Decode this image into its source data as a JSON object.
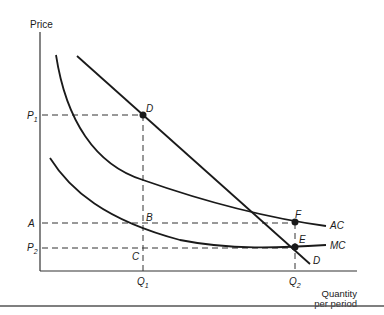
{
  "axes": {
    "y_label": "Price",
    "x_label_line1": "Quantity",
    "x_label_line2": "per period"
  },
  "price_levels": {
    "p1": "P",
    "p1_sub": "1",
    "a": "A",
    "p2": "P",
    "p2_sub": "2"
  },
  "quantity_levels": {
    "q1": "Q",
    "q1_sub": "1",
    "q2": "Q",
    "q2_sub": "2"
  },
  "points": {
    "d": "D",
    "b": "B",
    "c": "C",
    "f": "F",
    "e": "E"
  },
  "curves": {
    "ac": "AC",
    "mc": "MC",
    "demand": "D"
  },
  "colors": {
    "ink": "#1a1a1a",
    "rule": "#555555"
  }
}
